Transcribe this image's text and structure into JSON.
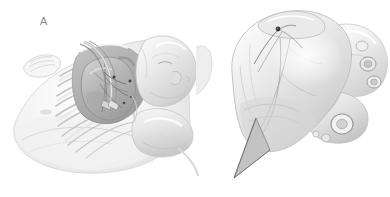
{
  "figure": {
    "type": "medical-illustration",
    "style": "grayscale pencil and wash anatomical drawing",
    "background_color": "#ffffff",
    "width": 390,
    "height": 197,
    "panel_count": 2
  },
  "panels": [
    {
      "id": "A",
      "label": "A",
      "label_color": "#8a8a8a",
      "label_x": 44,
      "label_y": 22,
      "subject": "infant in right lateral decubitus position with left thoracotomy exposing the heart between retracted ribs",
      "elements": [
        "infant-head-profile",
        "infant-raised-arm",
        "infant-torso",
        "rib-cage",
        "thoracotomy-incision",
        "rib-retractor-blades",
        "exposed-heart",
        "epicardial-lead-sutures",
        "surgeon-hand"
      ]
    },
    {
      "id": "B",
      "label": "B",
      "label_color": "#8a8a8a",
      "label_x": 222,
      "label_y": 21,
      "subject": "close-up anterior view of the heart showing epicardial pacing lead fixation point on the ventricle with pointer to apex",
      "elements": [
        "left-ventricle",
        "right-ventricle",
        "left-atrial-appendage",
        "great-vessels",
        "pulmonary-veins",
        "aorta",
        "coronary-vessels",
        "epicardial-electrode-point",
        "suture-threads",
        "apex-pointer-arrow"
      ]
    }
  ],
  "palette": {
    "background": "#ffffff",
    "outline_light": "#cfcfcf",
    "outline_mid": "#a8a8a8",
    "outline_dark": "#707070",
    "wash_pale": "#f0f0f0",
    "wash_light": "#e3e3e3",
    "wash_mid": "#cdcdcd",
    "wash_deep": "#b0b0b0",
    "shadow": "#8f8f8f",
    "accent_dark": "#4a4a4a",
    "label_gray": "#8a8a8a"
  },
  "annotations": {
    "electrode_marker_color": "#3c3c3c",
    "pointer_arrow_color": "#b9b9b9",
    "pointer_arrow_outline": "#6e6e6e"
  }
}
